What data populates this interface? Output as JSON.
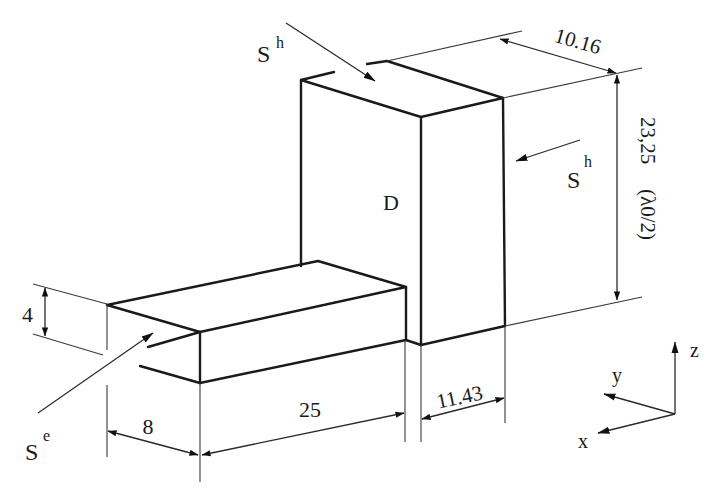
{
  "figure": {
    "type": "isometric waveguide / dielectric resonator schematic",
    "dielectric_label": "D",
    "ports": {
      "top_port": {
        "symbol": "S",
        "superscript": "h"
      },
      "side_port": {
        "symbol": "S",
        "superscript": "h"
      },
      "feed_port": {
        "symbol": "S",
        "superscript": "e"
      }
    },
    "dimensions": {
      "depth_top": "10.16",
      "height_main": "23,25",
      "height_note": "(λ0/2)",
      "feed_height": "4",
      "feed_offset": "8",
      "feed_length": "25",
      "main_width": "11.43"
    },
    "axes": {
      "x": "x",
      "y": "y",
      "z": "z"
    },
    "colors": {
      "line": "#1a1a1a",
      "background": "#ffffff"
    }
  }
}
